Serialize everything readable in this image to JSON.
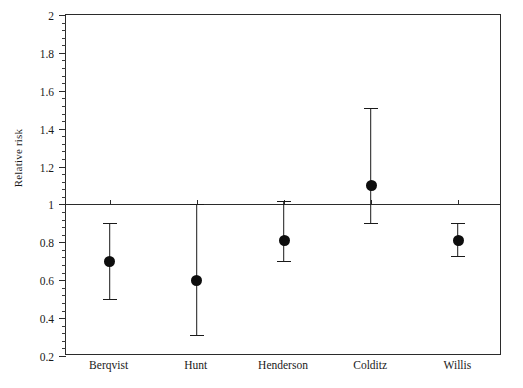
{
  "chart_data": {
    "type": "scatter",
    "subtype": "forest-plot",
    "title": "",
    "xlabel": "",
    "ylabel": "Relative risk",
    "ylim": [
      0.2,
      2
    ],
    "ytick_labels": [
      "2",
      "1.8",
      "1.6",
      "1.4",
      "1.2",
      "1",
      "0.8",
      "0.6",
      "0.4",
      "0.2"
    ],
    "ytick_values": [
      2,
      1.8,
      1.6,
      1.4,
      1.2,
      1,
      0.8,
      0.6,
      0.4,
      0.2
    ],
    "minor_tick_interval": 0.04,
    "grid": false,
    "legend": "none",
    "reference_line": 1,
    "categories": [
      "Berqvist",
      "Hunt",
      "Henderson",
      "Colditz",
      "Willis"
    ],
    "values": [
      0.7,
      0.6,
      0.81,
      1.1,
      0.81
    ],
    "ci_lower": [
      0.5,
      0.31,
      0.7,
      0.9,
      0.73
    ],
    "ci_upper": [
      0.9,
      1.0,
      1.02,
      1.51,
      0.9
    ],
    "series": [
      {
        "name": "Relative risk",
        "points": [
          {
            "label": "Berqvist",
            "value": 0.7,
            "low": 0.5,
            "high": 0.9
          },
          {
            "label": "Hunt",
            "value": 0.6,
            "low": 0.31,
            "high": 1.0
          },
          {
            "label": "Henderson",
            "value": 0.81,
            "low": 0.7,
            "high": 1.02
          },
          {
            "label": "Colditz",
            "value": 1.1,
            "low": 0.9,
            "high": 1.51
          },
          {
            "label": "Willis",
            "value": 0.81,
            "low": 0.73,
            "high": 0.9
          }
        ]
      }
    ],
    "colors": {
      "marker": "#0d0d0d",
      "whisker": "#1a1a1a",
      "axis": "#2b2b2b",
      "background": "#ffffff"
    }
  }
}
